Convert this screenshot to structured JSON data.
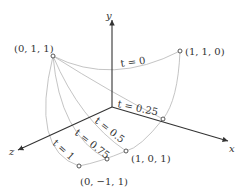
{
  "diagram": {
    "axes": {
      "x": "x",
      "y": "y",
      "z": "z"
    },
    "points": {
      "p011": "(0, 1, 1)",
      "p110": "(1, 1, 0)",
      "p101": "(1, 0, 1)",
      "p0m11": "(0, −1, 1)"
    },
    "curve_labels": {
      "t0": "t = 0",
      "t025": "t = 0.25",
      "t05": "t = 0.5",
      "t075": "t = 0.75",
      "t1": "t = 1"
    },
    "colors": {
      "curve": "#b5b5b5",
      "axis": "#333333",
      "text": "#333333"
    }
  }
}
